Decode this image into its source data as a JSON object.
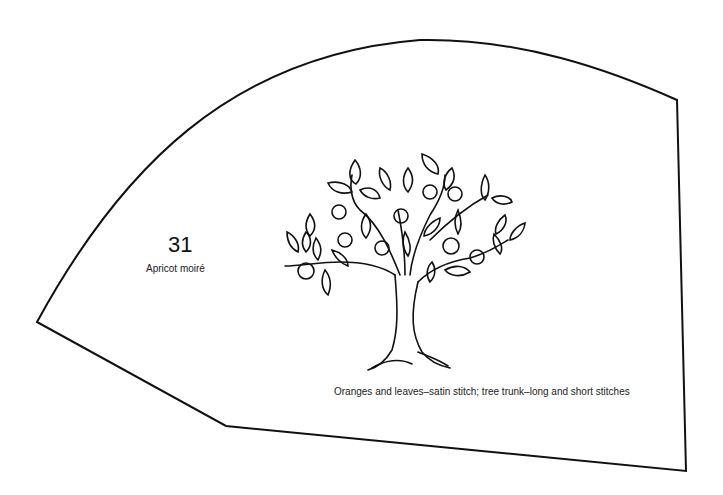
{
  "pattern": {
    "number": "31",
    "color_name": "Apricot moiré",
    "caption": "Oranges and leaves–satin stitch; tree trunk–long and short stitches",
    "motif": "orange-tree",
    "outline_color": "#111111",
    "background": "#ffffff"
  }
}
